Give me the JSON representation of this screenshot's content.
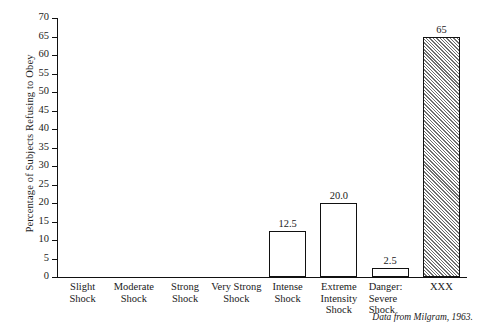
{
  "chart_data": {
    "type": "bar",
    "title": "",
    "xlabel": "",
    "ylabel": "Percentage of Subjects Refusing to Obey",
    "ylim": [
      0,
      70
    ],
    "ytick_step": 5,
    "yticks": [
      0,
      5,
      10,
      15,
      20,
      25,
      30,
      35,
      40,
      45,
      50,
      55,
      60,
      65,
      70
    ],
    "grid": false,
    "legend": "none",
    "categories": [
      "Slight\nShock",
      "Moderate\nShock",
      "Strong\nShock",
      "Very Strong\nShock",
      "Intense\nShock",
      "Extreme\nIntensity\nShock",
      "Danger:\nSevere\nShock",
      "XXX"
    ],
    "values": [
      0,
      0,
      0,
      0,
      12.5,
      20.0,
      2.5,
      65
    ],
    "value_labels": [
      "",
      "",
      "",
      "",
      "12.5",
      "20.0",
      "2.5",
      "65"
    ],
    "annotations": [
      "Data from Milgram, 1963."
    ]
  },
  "axis": {
    "ylabel": "Percentage of Subjects Refusing to Obey",
    "tick_labels": [
      "70",
      "65",
      "60",
      "55",
      "50",
      "45",
      "40",
      "35",
      "30",
      "25",
      "20",
      "15",
      "10",
      "5",
      "0"
    ]
  },
  "categories": [
    {
      "lines": [
        "Slight",
        "Shock"
      ],
      "value_label": "",
      "align": "center"
    },
    {
      "lines": [
        "Moderate",
        "Shock"
      ],
      "value_label": "",
      "align": "center"
    },
    {
      "lines": [
        "Strong",
        "Shock"
      ],
      "value_label": "",
      "align": "center"
    },
    {
      "lines": [
        "Very Strong",
        "Shock"
      ],
      "value_label": "",
      "align": "center"
    },
    {
      "lines": [
        "Intense",
        "Shock"
      ],
      "value_label": "12.5",
      "align": "center"
    },
    {
      "lines": [
        "Extreme",
        "Intensity",
        "Shock"
      ],
      "value_label": "20.0",
      "align": "center"
    },
    {
      "lines": [
        "Danger:",
        "Severe",
        "Shock"
      ],
      "value_label": "2.5",
      "align": "left"
    },
    {
      "lines": [
        "XXX"
      ],
      "value_label": "65",
      "align": "center"
    }
  ],
  "source_note": "Data from Milgram, 1963.",
  "colors": {
    "axis": "#111111",
    "bar_fill": "#ffffff",
    "bar_edge": "#111111",
    "hatch": "#6f6f6f",
    "text": "#1a1a1a",
    "background": "#ffffff"
  }
}
